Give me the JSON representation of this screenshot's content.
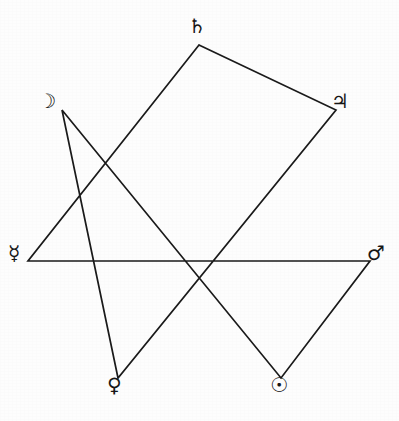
{
  "figure": {
    "type": "geometric-diagram",
    "background_color": "#fdfdfd",
    "stroke_color": "#1a1a1a",
    "stroke_width": 1.7,
    "center": {
      "x": 199,
      "y": 235
    },
    "radius": 192,
    "star_notation": "{7/3}",
    "point_count": 7,
    "path_points": "199,45 336,110 118,378 62,110 281,378 370,261 28,261 199,45"
  },
  "vertices": [
    {
      "key": "saturn",
      "planet": "Saturn",
      "glyph": "♄",
      "icon_name": "saturn-icon",
      "position": {
        "x": 199,
        "y": 45
      },
      "label_left": 188,
      "label_top": 16
    },
    {
      "key": "moon",
      "planet": "Moon",
      "glyph": "☽",
      "icon_name": "moon-icon",
      "position": {
        "x": 62,
        "y": 110
      },
      "label_left": 38,
      "label_top": 91
    },
    {
      "key": "jupiter",
      "planet": "Jupiter",
      "glyph": "♃",
      "icon_name": "jupiter-icon",
      "position": {
        "x": 336,
        "y": 110
      },
      "label_left": 331,
      "label_top": 91
    },
    {
      "key": "mercury",
      "planet": "Mercury",
      "glyph": "☿",
      "icon_name": "mercury-icon",
      "position": {
        "x": 28,
        "y": 261
      },
      "label_left": 8,
      "label_top": 243
    },
    {
      "key": "mars",
      "planet": "Mars",
      "glyph": "♂",
      "icon_name": "mars-icon",
      "position": {
        "x": 370,
        "y": 261
      },
      "label_left": 367,
      "label_top": 243
    },
    {
      "key": "venus",
      "planet": "Venus",
      "glyph": "♀",
      "icon_name": "venus-icon",
      "position": {
        "x": 118,
        "y": 378
      },
      "label_left": 107,
      "label_top": 375
    },
    {
      "key": "sun",
      "planet": "Sun",
      "glyph": "☉",
      "icon_name": "sun-icon",
      "position": {
        "x": 281,
        "y": 378
      },
      "label_left": 270,
      "label_top": 375
    }
  ]
}
